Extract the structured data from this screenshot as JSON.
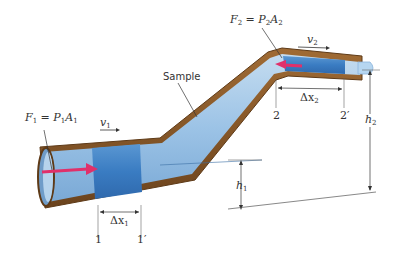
{
  "diagram": {
    "colors": {
      "pipe_wall": "#8a5a2b",
      "pipe_wall_dark": "#5e3a17",
      "fluid_light": "#a9cbe8",
      "fluid_mid": "#7fb0dc",
      "fluid_sample": "#3d7fc4",
      "force_arrow": "#e0306a",
      "annotation": "#333333"
    },
    "labels": {
      "f1": {
        "sym": "F",
        "sub": "1",
        "eq": " = ",
        "p": "P",
        "psub": "1",
        "a": "A",
        "asub": "1"
      },
      "f2": {
        "sym": "F",
        "sub": "2",
        "eq": " = ",
        "p": "P",
        "psub": "2",
        "a": "A",
        "asub": "2"
      },
      "v1": {
        "sym": "v",
        "sub": "1"
      },
      "v2": {
        "sym": "v",
        "sub": "2"
      },
      "sample": "Sample",
      "dx1": {
        "sym": "Δx",
        "sub": "1"
      },
      "dx2": {
        "sym": "Δx",
        "sub": "2"
      },
      "h1": {
        "sym": "h",
        "sub": "1"
      },
      "h2": {
        "sym": "h",
        "sub": "2"
      },
      "pos_1": "1",
      "pos_1p": "1′",
      "pos_2": "2",
      "pos_2p": "2′"
    }
  }
}
